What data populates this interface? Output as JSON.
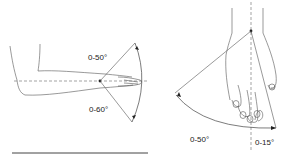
{
  "figure": {
    "left_diagram": {
      "subject": "forearm-wrist-lateral-view",
      "motion": "wrist flexion/extension",
      "upper_label": "0-50°",
      "lower_label": "0-60°"
    },
    "right_diagram": {
      "subject": "hand-dorsal-view",
      "motion": "wrist radial/ulnar deviation",
      "left_label": "0-50°",
      "right_label": "0-15°"
    },
    "colors": {
      "line": "#555555",
      "text": "#222222",
      "rule": "#444444"
    }
  }
}
